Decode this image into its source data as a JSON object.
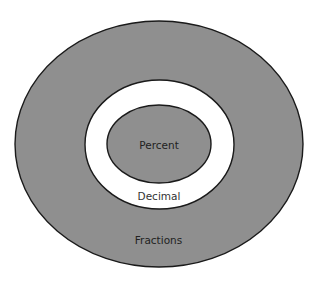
{
  "diagram": {
    "type": "nested-sets",
    "colors": {
      "background": "#ffffff",
      "shaded_fill": "#8f8f8f",
      "unshaded_fill": "#ffffff",
      "outline": "#1a1a1a",
      "label_on_shaded": "#222222",
      "label_on_unshaded": "#333333"
    },
    "sets": [
      {
        "id": "fractions",
        "label": "Fractions",
        "level": 0,
        "shaded": true
      },
      {
        "id": "decimal",
        "label": "Decimal",
        "level": 1,
        "shaded": false
      },
      {
        "id": "percent",
        "label": "Percent",
        "level": 2,
        "shaded": true
      }
    ]
  }
}
